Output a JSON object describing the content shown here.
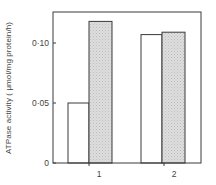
{
  "chart_data": {
    "type": "bar",
    "title": "",
    "xlabel": "",
    "ylabel": "ATPase activity ( μmol/mg protein/h)",
    "categories": [
      "1",
      "2"
    ],
    "series": [
      {
        "name": "open",
        "fill": "#ffffff",
        "values": [
          0.05,
          0.107
        ]
      },
      {
        "name": "shaded",
        "fill": "#d9d9d9",
        "values": [
          0.118,
          0.109
        ]
      }
    ],
    "ylim": [
      0,
      0.118
    ],
    "yticks": [
      0,
      0.05,
      0.1
    ],
    "ytick_labels": [
      "0",
      "0·05",
      "0·10"
    ],
    "grid": false,
    "legend": "none"
  },
  "colors": {
    "axis": "#3a3a3a",
    "bar_edge": "#3a3a3a",
    "shaded_fill": "#d9d9d9"
  }
}
